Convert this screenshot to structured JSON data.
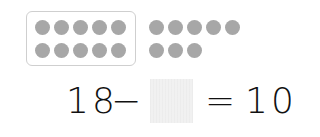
{
  "problem": {
    "minuend": "18",
    "operator": "−",
    "answer_value": "",
    "equals": "=",
    "result": "10"
  },
  "counters": {
    "color": "#a7a7a7",
    "grouped_count": 10,
    "ungrouped_count": 8,
    "total": 18
  }
}
